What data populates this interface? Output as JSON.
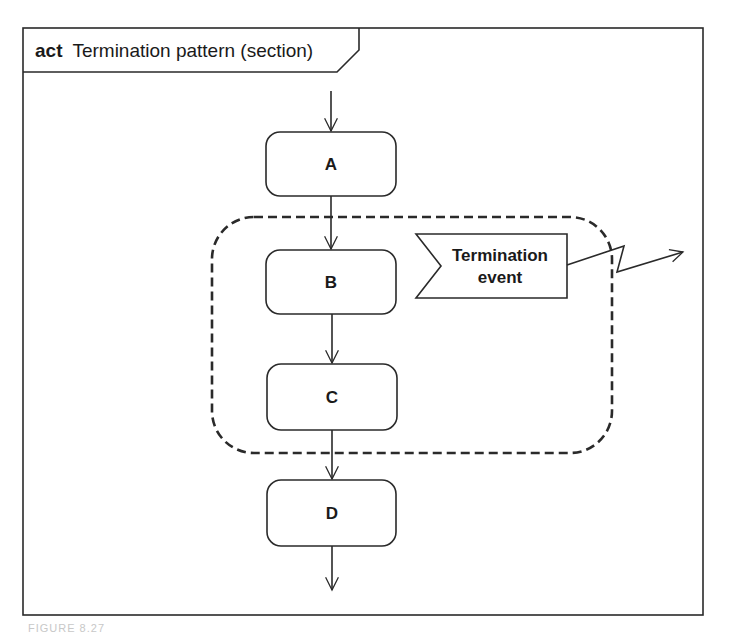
{
  "diagram": {
    "type": "UML activity diagram",
    "frame": {
      "keyword": "act",
      "title": "Termination pattern (section)"
    },
    "actions": [
      {
        "id": "A",
        "label": "A"
      },
      {
        "id": "B",
        "label": "B"
      },
      {
        "id": "C",
        "label": "C"
      },
      {
        "id": "D",
        "label": "D"
      }
    ],
    "interruptible_region": {
      "contains": [
        "B",
        "C",
        "Termination event"
      ],
      "style": "dashed rounded rectangle"
    },
    "accept_event": {
      "line1": "Termination",
      "line2": "event"
    },
    "flows": [
      {
        "from": "initial",
        "to": "A"
      },
      {
        "from": "A",
        "to": "B"
      },
      {
        "from": "B",
        "to": "C"
      },
      {
        "from": "C",
        "to": "D"
      },
      {
        "from": "D",
        "to": "final"
      },
      {
        "from": "Termination event",
        "to": "outside",
        "kind": "interrupting edge"
      }
    ],
    "caption": "FIGURE 8.27"
  },
  "colors": {
    "line": "#2a2a2a",
    "background": "#ffffff"
  }
}
